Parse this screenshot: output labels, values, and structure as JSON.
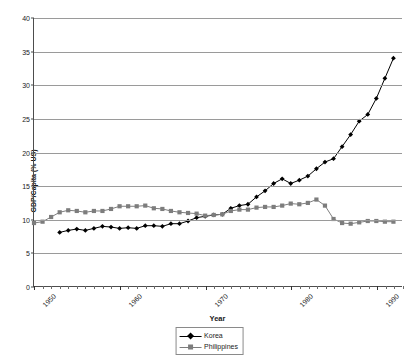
{
  "chart_data": {
    "type": "line",
    "title": "",
    "xlabel": "Year",
    "ylabel": "GDP/Capita (% US)",
    "xlim": [
      1950,
      1993
    ],
    "ylim": [
      0,
      40
    ],
    "ytick_values": [
      0,
      5,
      10,
      15,
      20,
      25,
      30,
      35,
      40
    ],
    "ytick_labels": [
      "0",
      "5",
      "10",
      "15",
      "20",
      "25",
      "30",
      "35",
      "40"
    ],
    "xtick_labels": [
      "1950",
      "1960",
      "1970",
      "1980",
      "1990"
    ],
    "xtick_values": [
      1950,
      1960,
      1970,
      1980,
      1990
    ],
    "grid": "horizontal",
    "legend_position": "bottom-center",
    "series": [
      {
        "name": "Korea",
        "color": "#000000",
        "marker": "diamond",
        "x": [
          1953,
          1954,
          1955,
          1956,
          1957,
          1958,
          1959,
          1960,
          1961,
          1962,
          1963,
          1964,
          1965,
          1966,
          1967,
          1968,
          1969,
          1970,
          1971,
          1972,
          1973,
          1974,
          1975,
          1976,
          1977,
          1978,
          1979,
          1980,
          1981,
          1982,
          1983,
          1984,
          1985,
          1986,
          1987,
          1988,
          1989,
          1990,
          1991,
          1992
        ],
        "values": [
          8.0,
          8.3,
          8.5,
          8.3,
          8.6,
          8.9,
          8.8,
          8.6,
          8.7,
          8.6,
          9.0,
          9.0,
          8.9,
          9.3,
          9.3,
          9.7,
          10.2,
          10.4,
          10.6,
          10.7,
          11.6,
          12.0,
          12.2,
          13.3,
          14.2,
          15.3,
          16.0,
          15.3,
          15.8,
          16.4,
          17.5,
          18.5,
          19.0,
          20.8,
          22.6,
          24.6,
          25.6,
          28.0,
          31.0,
          34.0
        ]
      },
      {
        "name": "Philippines",
        "color": "#7d7d7d",
        "marker": "square",
        "x": [
          1950,
          1951,
          1952,
          1953,
          1954,
          1955,
          1956,
          1957,
          1958,
          1959,
          1960,
          1961,
          1962,
          1963,
          1964,
          1965,
          1966,
          1967,
          1968,
          1969,
          1970,
          1971,
          1972,
          1973,
          1974,
          1975,
          1976,
          1977,
          1978,
          1979,
          1980,
          1981,
          1982,
          1983,
          1984,
          1985,
          1986,
          1987,
          1988,
          1989,
          1990,
          1991,
          1992
        ],
        "values": [
          9.4,
          9.6,
          10.3,
          11.0,
          11.3,
          11.2,
          11.0,
          11.2,
          11.2,
          11.5,
          11.9,
          11.9,
          11.9,
          12.0,
          11.6,
          11.5,
          11.2,
          11.0,
          10.9,
          10.8,
          10.5,
          10.6,
          10.7,
          11.2,
          11.4,
          11.4,
          11.7,
          11.8,
          11.8,
          12.0,
          12.3,
          12.2,
          12.4,
          12.9,
          12.0,
          10.0,
          9.4,
          9.3,
          9.5,
          9.7,
          9.7,
          9.6,
          9.6
        ]
      }
    ]
  }
}
